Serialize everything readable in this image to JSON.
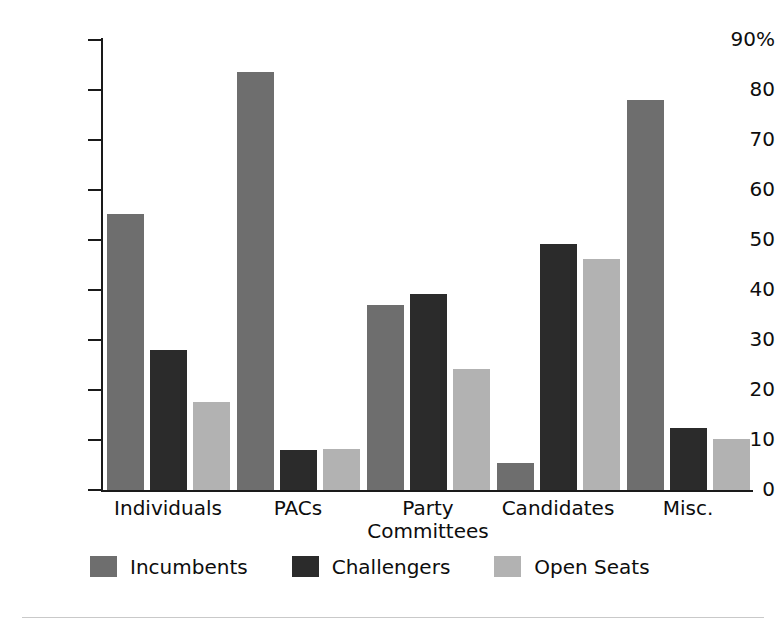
{
  "chart_data": {
    "type": "bar",
    "title": "",
    "xlabel": "",
    "ylabel": "",
    "categories": [
      "Individuals",
      "PACs",
      "Party\nCommittees",
      "Candidates",
      "Misc."
    ],
    "category_labels": [
      {
        "line1": "Individuals",
        "line2": ""
      },
      {
        "line1": "PACs",
        "line2": ""
      },
      {
        "line1": "Party",
        "line2": "Committees"
      },
      {
        "line1": "Candidates",
        "line2": ""
      },
      {
        "line1": "Misc.",
        "line2": ""
      }
    ],
    "series": [
      {
        "name": "Incumbents",
        "color": "#6e6e6e",
        "values": [
          55.2,
          83.6,
          37.0,
          5.4,
          78.1
        ]
      },
      {
        "name": "Challengers",
        "color": "#2b2b2b",
        "values": [
          28.1,
          8.1,
          39.2,
          49.3,
          12.4
        ]
      },
      {
        "name": "Open Seats",
        "color": "#b2b2b2",
        "values": [
          17.6,
          8.2,
          24.3,
          46.2,
          10.3
        ]
      }
    ],
    "ylim": [
      0,
      90
    ],
    "ytick_values": [
      0,
      10,
      20,
      30,
      40,
      50,
      60,
      70,
      80,
      90
    ],
    "ytick_labels": [
      "0",
      "10",
      "20",
      "30",
      "40",
      "50",
      "60",
      "70",
      "80",
      "90%"
    ],
    "grid": false,
    "legend_position": "bottom",
    "legend": [
      {
        "label": "Incumbents",
        "color": "#6e6e6e"
      },
      {
        "label": "Challengers",
        "color": "#2b2b2b"
      },
      {
        "label": "Open Seats",
        "color": "#b2b2b2"
      }
    ]
  },
  "axis": {
    "line_color": "#1a1a1a"
  }
}
